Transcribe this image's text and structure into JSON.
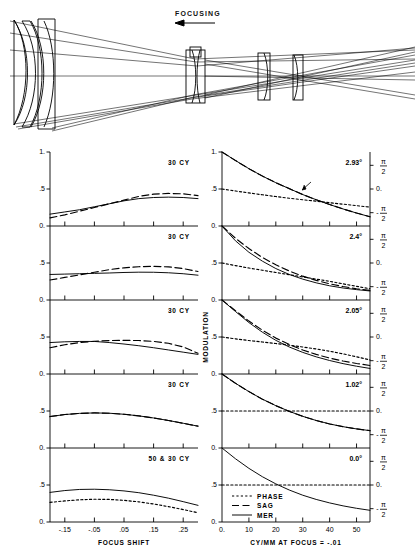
{
  "figure": {
    "type": "optical-mtf-figure",
    "diagram": {
      "title": "FOCUSING",
      "arrow_direction": "left",
      "element_count": 6,
      "name": "lens-ray-trace-diagram"
    },
    "left_column": {
      "ylabel": "",
      "xlabel": "FOCUS SHIFT",
      "ytick_labels": [
        "1.",
        ".5",
        "0."
      ],
      "ytick_values": [
        1.0,
        0.5,
        0.0
      ],
      "xtick_labels": [
        "-.15",
        "-.05",
        ".05",
        ".15",
        ".25"
      ],
      "xtick_values": [
        -0.15,
        -0.05,
        0.05,
        0.15,
        0.25
      ],
      "panel_labels": [
        "30  CY",
        "30  CY",
        "30  CY",
        "30  CY",
        "50 & 30  CY"
      ]
    },
    "right_column": {
      "ylabel": "MODULATION",
      "xlabel": "CY/MM AT FOCUS = -.01",
      "ytick_labels": [
        "1.",
        ".5",
        "0."
      ],
      "ytick_values": [
        1.0,
        0.5,
        0.0
      ],
      "xtick_labels": [
        "0.",
        "10",
        "20",
        "30",
        "40",
        "50"
      ],
      "xtick_values": [
        0,
        10,
        20,
        30,
        40,
        50
      ],
      "right_axis_tick_labels": [
        "π/2",
        "0.",
        "-π/2"
      ],
      "panel_labels": [
        "2.93°",
        "2.4°",
        "2.05°",
        "1.02°",
        "0.0°"
      ]
    },
    "legend": {
      "title": "",
      "items": [
        {
          "label": "PHASE",
          "style": "dotted"
        },
        {
          "label": "SAG",
          "style": "dashed"
        },
        {
          "label": "MER",
          "style": "solid"
        }
      ]
    },
    "colors": {
      "ink": "#000000",
      "background": "#ffffff",
      "axis": "#000000"
    }
  },
  "chart_data": [
    {
      "type": "line",
      "id": "focus-shift-panel-1",
      "title": "30  CY",
      "xlabel": "FOCUS SHIFT",
      "ylabel": "MODULATION",
      "xlim": [
        -0.2,
        0.3
      ],
      "ylim": [
        0.0,
        1.0
      ],
      "grid": false,
      "x": [
        -0.2,
        -0.15,
        -0.1,
        -0.05,
        0.0,
        0.05,
        0.1,
        0.15,
        0.2,
        0.25,
        0.3
      ],
      "series": [
        {
          "name": "MER",
          "style": "solid",
          "values": [
            0.16,
            0.19,
            0.22,
            0.26,
            0.3,
            0.34,
            0.37,
            0.385,
            0.39,
            0.385,
            0.37
          ]
        },
        {
          "name": "SAG",
          "style": "dashed",
          "values": [
            0.11,
            0.15,
            0.2,
            0.25,
            0.3,
            0.35,
            0.4,
            0.43,
            0.44,
            0.435,
            0.41
          ]
        }
      ]
    },
    {
      "type": "line",
      "id": "focus-shift-panel-2",
      "title": "30  CY",
      "xlabel": "FOCUS SHIFT",
      "ylabel": "MODULATION",
      "xlim": [
        -0.2,
        0.3
      ],
      "ylim": [
        0.0,
        1.0
      ],
      "grid": false,
      "x": [
        -0.2,
        -0.15,
        -0.1,
        -0.05,
        0.0,
        0.05,
        0.1,
        0.15,
        0.2,
        0.25,
        0.3
      ],
      "series": [
        {
          "name": "MER",
          "style": "solid",
          "values": [
            0.345,
            0.35,
            0.355,
            0.36,
            0.365,
            0.372,
            0.376,
            0.375,
            0.368,
            0.355,
            0.335
          ]
        },
        {
          "name": "SAG",
          "style": "dashed",
          "values": [
            0.27,
            0.305,
            0.34,
            0.375,
            0.41,
            0.435,
            0.45,
            0.455,
            0.448,
            0.425,
            0.385
          ]
        }
      ]
    },
    {
      "type": "line",
      "id": "focus-shift-panel-3",
      "title": "30  CY",
      "xlabel": "FOCUS SHIFT",
      "ylabel": "MODULATION",
      "xlim": [
        -0.2,
        0.3
      ],
      "ylim": [
        0.0,
        1.0
      ],
      "grid": false,
      "x": [
        -0.2,
        -0.15,
        -0.1,
        -0.05,
        0.0,
        0.05,
        0.1,
        0.15,
        0.2,
        0.25,
        0.3
      ],
      "series": [
        {
          "name": "MER",
          "style": "solid",
          "values": [
            0.425,
            0.435,
            0.44,
            0.44,
            0.425,
            0.405,
            0.382,
            0.355,
            0.325,
            0.295,
            0.265
          ]
        },
        {
          "name": "SAG",
          "style": "dashed",
          "values": [
            0.355,
            0.395,
            0.425,
            0.442,
            0.452,
            0.455,
            0.452,
            0.44,
            0.415,
            0.365,
            0.28
          ]
        }
      ]
    },
    {
      "type": "line",
      "id": "focus-shift-panel-4",
      "title": "30  CY",
      "xlabel": "FOCUS SHIFT",
      "ylabel": "MODULATION",
      "xlim": [
        -0.2,
        0.3
      ],
      "ylim": [
        0.0,
        1.0
      ],
      "grid": false,
      "x": [
        -0.2,
        -0.15,
        -0.1,
        -0.05,
        0.0,
        0.05,
        0.1,
        0.15,
        0.2,
        0.25,
        0.3
      ],
      "series": [
        {
          "name": "MER",
          "style": "solid",
          "values": [
            0.425,
            0.452,
            0.468,
            0.474,
            0.47,
            0.456,
            0.434,
            0.406,
            0.372,
            0.334,
            0.295
          ]
        },
        {
          "name": "SAG",
          "style": "dashed",
          "values": [
            0.425,
            0.452,
            0.468,
            0.474,
            0.47,
            0.456,
            0.434,
            0.406,
            0.372,
            0.334,
            0.295
          ]
        }
      ]
    },
    {
      "type": "line",
      "id": "focus-shift-panel-5",
      "title": "50 & 30  CY",
      "xlabel": "FOCUS SHIFT",
      "ylabel": "MODULATION",
      "xlim": [
        -0.2,
        0.3
      ],
      "ylim": [
        0.0,
        1.0
      ],
      "grid": false,
      "x": [
        -0.2,
        -0.15,
        -0.1,
        -0.05,
        0.0,
        0.05,
        0.1,
        0.15,
        0.2,
        0.25,
        0.3
      ],
      "series": [
        {
          "name": "MER",
          "style": "solid",
          "values": [
            0.4,
            0.425,
            0.44,
            0.443,
            0.436,
            0.42,
            0.396,
            0.362,
            0.322,
            0.275,
            0.225
          ]
        },
        {
          "name": "PHASE",
          "style": "dotted",
          "values": [
            0.265,
            0.285,
            0.3,
            0.308,
            0.305,
            0.293,
            0.272,
            0.243,
            0.208,
            0.168,
            0.125
          ]
        }
      ]
    },
    {
      "type": "line",
      "id": "mtf-cymm-panel-1",
      "title": "2.93°",
      "xlabel": "CY/MM AT FOCUS = -.01",
      "ylabel": "MODULATION",
      "xlim": [
        0,
        55
      ],
      "ylim": [
        0.0,
        1.0
      ],
      "y2_ticks": [
        "π/2",
        "0.",
        "-π/2"
      ],
      "grid": false,
      "x": [
        0,
        5,
        10,
        15,
        20,
        25,
        30,
        35,
        40,
        45,
        50,
        55
      ],
      "series": [
        {
          "name": "MER",
          "style": "solid",
          "values": [
            1.0,
            0.885,
            0.775,
            0.675,
            0.585,
            0.505,
            0.425,
            0.355,
            0.29,
            0.23,
            0.175,
            0.125
          ]
        },
        {
          "name": "SAG",
          "style": "dashed",
          "values": [
            1.0,
            0.885,
            0.775,
            0.675,
            0.585,
            0.505,
            0.425,
            0.355,
            0.29,
            0.23,
            0.175,
            0.125
          ]
        },
        {
          "name": "PHASE",
          "style": "dotted",
          "values": [
            0.5,
            0.473,
            0.447,
            0.422,
            0.398,
            0.375,
            0.355,
            0.335,
            0.315,
            0.295,
            0.275,
            0.255
          ]
        }
      ]
    },
    {
      "type": "line",
      "id": "mtf-cymm-panel-2",
      "title": "2.4°",
      "xlabel": "CY/MM AT FOCUS = -.01",
      "ylabel": "MODULATION",
      "xlim": [
        0,
        55
      ],
      "ylim": [
        0.0,
        1.0
      ],
      "y2_ticks": [
        "π/2",
        "0.",
        "-π/2"
      ],
      "grid": false,
      "x": [
        0,
        5,
        10,
        15,
        20,
        25,
        30,
        35,
        40,
        45,
        50,
        55
      ],
      "series": [
        {
          "name": "MER",
          "style": "solid",
          "values": [
            1.0,
            0.8,
            0.645,
            0.525,
            0.425,
            0.345,
            0.282,
            0.232,
            0.192,
            0.162,
            0.14,
            0.122
          ]
        },
        {
          "name": "SAG",
          "style": "dashed",
          "values": [
            1.0,
            0.835,
            0.695,
            0.575,
            0.475,
            0.392,
            0.322,
            0.265,
            0.218,
            0.182,
            0.152,
            0.13
          ]
        },
        {
          "name": "PHASE",
          "style": "dotted",
          "values": [
            0.5,
            0.465,
            0.432,
            0.402,
            0.372,
            0.342,
            0.312,
            0.282,
            0.252,
            0.218,
            0.185,
            0.152
          ]
        }
      ]
    },
    {
      "type": "line",
      "id": "mtf-cymm-panel-3",
      "title": "2.05°",
      "xlabel": "CY/MM AT FOCUS = -.01",
      "ylabel": "MODULATION",
      "xlim": [
        0,
        55
      ],
      "ylim": [
        0.0,
        1.0
      ],
      "y2_ticks": [
        "π/2",
        "0.",
        "-π/2"
      ],
      "grid": false,
      "x": [
        0,
        5,
        10,
        15,
        20,
        25,
        30,
        35,
        40,
        45,
        50,
        55
      ],
      "series": [
        {
          "name": "MER",
          "style": "solid",
          "values": [
            1.0,
            0.845,
            0.695,
            0.565,
            0.455,
            0.365,
            0.292,
            0.232,
            0.182,
            0.14,
            0.105,
            0.075
          ]
        },
        {
          "name": "SAG",
          "style": "dashed",
          "values": [
            1.0,
            0.855,
            0.715,
            0.592,
            0.485,
            0.398,
            0.325,
            0.265,
            0.215,
            0.175,
            0.142,
            0.115
          ]
        },
        {
          "name": "PHASE",
          "style": "dotted",
          "values": [
            0.5,
            0.475,
            0.452,
            0.432,
            0.412,
            0.39,
            0.365,
            0.338,
            0.308,
            0.272,
            0.232,
            0.19
          ]
        }
      ]
    },
    {
      "type": "line",
      "id": "mtf-cymm-panel-4",
      "title": "1.02°",
      "xlabel": "CY/MM AT FOCUS = -.01",
      "ylabel": "MODULATION",
      "xlim": [
        0,
        55
      ],
      "ylim": [
        0.0,
        1.0
      ],
      "y2_ticks": [
        "π/2",
        "0.",
        "-π/2"
      ],
      "grid": false,
      "x": [
        0,
        5,
        10,
        15,
        20,
        25,
        30,
        35,
        40,
        45,
        50,
        55
      ],
      "series": [
        {
          "name": "MER",
          "style": "solid",
          "values": [
            1.0,
            0.875,
            0.762,
            0.66,
            0.572,
            0.495,
            0.428,
            0.372,
            0.325,
            0.288,
            0.258,
            0.235
          ]
        },
        {
          "name": "SAG",
          "style": "dashed",
          "values": [
            1.0,
            0.875,
            0.762,
            0.66,
            0.572,
            0.495,
            0.428,
            0.372,
            0.325,
            0.288,
            0.258,
            0.235
          ]
        },
        {
          "name": "PHASE",
          "style": "dotted",
          "values": [
            0.5,
            0.5,
            0.5,
            0.5,
            0.5,
            0.5,
            0.5,
            0.5,
            0.5,
            0.5,
            0.5,
            0.5
          ]
        }
      ]
    },
    {
      "type": "line",
      "id": "mtf-cymm-panel-5",
      "title": "0.0°",
      "xlabel": "CY/MM AT FOCUS = -.01",
      "ylabel": "MODULATION",
      "xlim": [
        0,
        55
      ],
      "ylim": [
        0.0,
        1.0
      ],
      "y2_ticks": [
        "π/2",
        "0.",
        "-π/2"
      ],
      "grid": false,
      "x": [
        0,
        5,
        10,
        15,
        20,
        25,
        30,
        35,
        40,
        45,
        50,
        55
      ],
      "series": [
        {
          "name": "MER",
          "style": "solid",
          "values": [
            1.0,
            0.855,
            0.725,
            0.612,
            0.515,
            0.432,
            0.362,
            0.305,
            0.258,
            0.218,
            0.185,
            0.158
          ]
        },
        {
          "name": "PHASE",
          "style": "dotted",
          "values": [
            0.5,
            0.5,
            0.5,
            0.5,
            0.5,
            0.5,
            0.5,
            0.5,
            0.5,
            0.5,
            0.5,
            0.5
          ]
        }
      ]
    }
  ]
}
